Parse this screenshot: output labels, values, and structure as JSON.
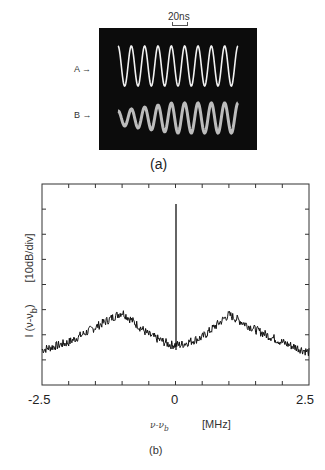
{
  "panel_a": {
    "caption": "(a)",
    "scale_label": "20ns",
    "trace_labels": [
      "A →",
      "B →"
    ],
    "screen_color": "#0c0c0c",
    "trace_color": "#f0f0f0"
  },
  "panel_b": {
    "caption": "(b)",
    "ylabel_main": "I (ν-ν",
    "ylabel_sub": "b",
    "ylabel_close": ")",
    "ylabel_unit": "[10dB/div]",
    "xlabel_symbol": "ν-ν",
    "xlabel_sub": "b",
    "xlabel_unit": "[MHz]",
    "xtick_labels": [
      "-2.5",
      "0",
      "2.5"
    ]
  },
  "chart_data": [
    {
      "type": "image",
      "title": "(a)",
      "description": "Oscilloscope traces A and B, sinusoidal beat signals",
      "annotations": [
        "20ns",
        "A",
        "B"
      ],
      "series": [
        {
          "name": "A",
          "cycles_visible": 9,
          "amplitude": "constant"
        },
        {
          "name": "B",
          "cycles_visible": 9,
          "amplitude": "growing"
        }
      ]
    },
    {
      "type": "line",
      "title": "(b)",
      "xlabel": "ν-ν_b [MHz]",
      "ylabel": "I (ν-ν_b) [10dB/div]",
      "xlim": [
        -2.5,
        2.5
      ],
      "xticks": [
        -2.5,
        -2.0,
        -1.5,
        -1.0,
        -0.5,
        0,
        0.5,
        1.0,
        1.5,
        2.0,
        2.5
      ],
      "xtick_labels": [
        "-2.5",
        "0",
        "2.5"
      ],
      "ylim_divisions": 8,
      "y_units": "dB relative (10 dB/div)",
      "grid": false,
      "x": [
        -2.5,
        -2.0,
        -1.5,
        -1.0,
        -0.5,
        -0.1,
        0,
        0.1,
        0.5,
        1.0,
        1.5,
        2.0,
        2.5
      ],
      "values_div": [
        1.4,
        1.7,
        2.3,
        2.9,
        2.0,
        1.6,
        7.2,
        1.6,
        1.9,
        2.8,
        2.2,
        1.7,
        1.3
      ],
      "annotations": [
        "narrow carrier spike at 0 MHz",
        "sidebands peaking near ±1 MHz"
      ]
    }
  ]
}
